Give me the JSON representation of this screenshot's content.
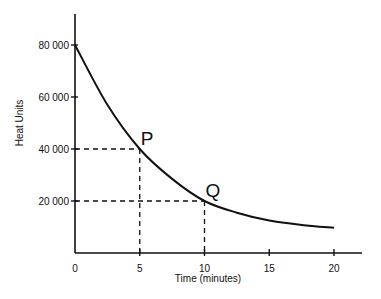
{
  "chart_data": {
    "type": "line",
    "title": "",
    "xlabel": "Time (minutes)",
    "ylabel": "Heat Units",
    "xlim": [
      0,
      22
    ],
    "ylim": [
      0,
      90000
    ],
    "grid": false,
    "legend": null,
    "x_ticks": [
      0,
      5,
      10,
      15,
      20
    ],
    "x_tick_labels": [
      "0",
      "5",
      "10",
      "15",
      "20"
    ],
    "y_ticks": [
      20000,
      40000,
      60000,
      80000
    ],
    "y_tick_labels": [
      "20 000",
      "40 000",
      "60 000",
      "80 000"
    ],
    "series": [
      {
        "name": "Heat Units",
        "x": [
          0,
          2.5,
          5,
          7.5,
          10,
          12.5,
          15,
          17.5,
          20
        ],
        "values": [
          80000,
          57000,
          40000,
          28500,
          20000,
          15500,
          12500,
          10800,
          9700
        ]
      }
    ],
    "annotations": [
      {
        "label": "P",
        "x": 5,
        "y": 40000,
        "dashed_guides": true
      },
      {
        "label": "Q",
        "x": 10,
        "y": 20000,
        "dashed_guides": true
      }
    ]
  }
}
